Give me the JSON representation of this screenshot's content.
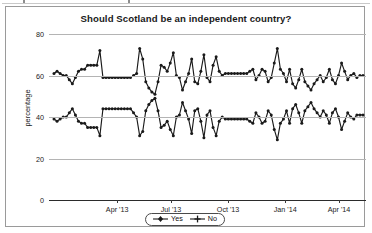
{
  "chart_data": {
    "type": "line",
    "title": "Should Scotland be an independent country?",
    "xlabel": "",
    "ylabel": "percentage",
    "ylim": [
      0,
      80
    ],
    "yticks": [
      0,
      20,
      40,
      60,
      80
    ],
    "ytick_labels": [
      "0",
      "20",
      "40",
      "60",
      "80"
    ],
    "xtick_labels": [
      "Apr '13",
      "Jul '13",
      "Oct '13",
      "Jan '14",
      "Apr '14"
    ],
    "xtick_positions": [
      0.215,
      0.385,
      0.565,
      0.745,
      0.915
    ],
    "xlim_description": "Jan '13 to mid-May '14",
    "grid": true,
    "legend_position": "bottom-center",
    "series": [
      {
        "name": "Yes",
        "marker": "filled-diamond",
        "color": "#1a1a1a",
        "values": [
          61,
          62,
          61,
          60,
          60,
          58,
          56,
          59,
          62,
          63,
          63,
          65,
          65,
          65,
          65,
          72,
          59,
          59,
          59,
          59,
          59,
          59,
          59,
          59,
          59,
          59,
          60,
          61,
          73,
          68,
          57,
          54,
          52,
          51,
          57,
          65,
          64,
          62,
          66,
          71,
          60,
          59,
          53,
          57,
          61,
          68,
          57,
          56,
          62,
          70,
          59,
          57,
          65,
          69,
          62,
          60,
          61,
          61,
          61,
          61,
          61,
          61,
          61,
          61,
          62,
          63,
          58,
          60,
          63,
          62,
          57,
          59,
          66,
          73,
          63,
          61,
          57,
          63,
          56,
          54,
          58,
          63,
          57,
          55,
          53,
          56,
          58,
          60,
          57,
          59,
          63,
          58,
          56,
          60,
          66,
          62,
          58,
          60,
          61,
          59,
          60,
          60
        ]
      },
      {
        "name": "No",
        "marker": "plus",
        "color": "#1a1a1a",
        "values": [
          39,
          38,
          39,
          40,
          40,
          42,
          44,
          41,
          38,
          37,
          37,
          35,
          35,
          35,
          35,
          31,
          44,
          44,
          44,
          44,
          44,
          44,
          44,
          44,
          44,
          44,
          42,
          40,
          31,
          33,
          43,
          46,
          48,
          49,
          43,
          35,
          36,
          38,
          34,
          31,
          40,
          41,
          47,
          43,
          39,
          32,
          43,
          44,
          38,
          30,
          41,
          43,
          35,
          31,
          38,
          40,
          39,
          39,
          39,
          39,
          39,
          39,
          39,
          39,
          38,
          37,
          42,
          40,
          37,
          38,
          43,
          41,
          34,
          29,
          37,
          39,
          43,
          37,
          44,
          46,
          42,
          37,
          43,
          45,
          47,
          44,
          42,
          40,
          43,
          41,
          37,
          42,
          44,
          40,
          34,
          38,
          42,
          40,
          39,
          41,
          41,
          41
        ]
      }
    ]
  },
  "legend": {
    "items": [
      {
        "label": "Yes"
      },
      {
        "label": "No"
      }
    ]
  }
}
